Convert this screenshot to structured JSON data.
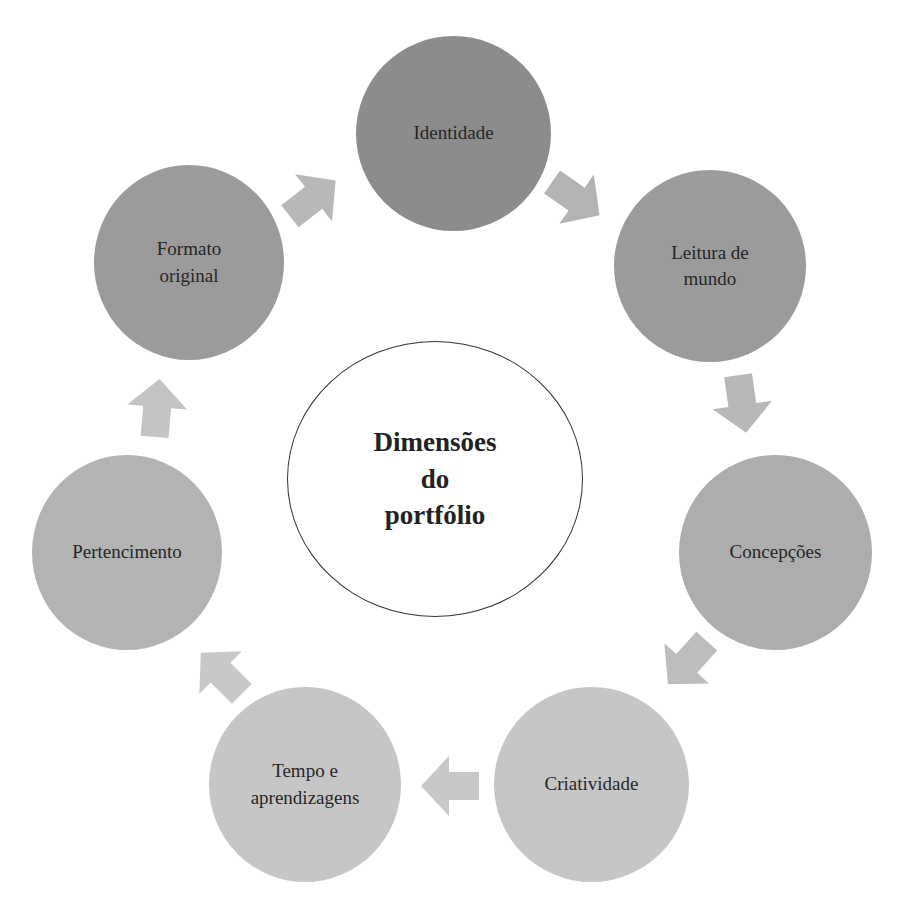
{
  "diagram": {
    "center": {
      "label": "Dimensões\ndo\nportfólio"
    },
    "nodes": [
      {
        "id": "identidade",
        "label": "Identidade",
        "color": "#8c8c8c"
      },
      {
        "id": "leitura",
        "label": "Leitura de\nmundo",
        "color": "#9b9b9b"
      },
      {
        "id": "concepcoes",
        "label": "Concepções",
        "color": "#adadad"
      },
      {
        "id": "criatividade",
        "label": "Criatividade",
        "color": "#c6c6c6"
      },
      {
        "id": "tempo",
        "label": "Tempo e\naprendizagens",
        "color": "#c6c6c6"
      },
      {
        "id": "pertencimento",
        "label": "Pertencimento",
        "color": "#b3b3b3"
      },
      {
        "id": "formato",
        "label": "Formato\noriginal",
        "color": "#9b9b9b"
      }
    ],
    "flow": [
      "Identidade",
      "Leitura de mundo",
      "Concepções",
      "Criatividade",
      "Tempo e aprendizagens",
      "Pertencimento",
      "Formato original"
    ],
    "arrow_color": "#b5b5b5"
  }
}
